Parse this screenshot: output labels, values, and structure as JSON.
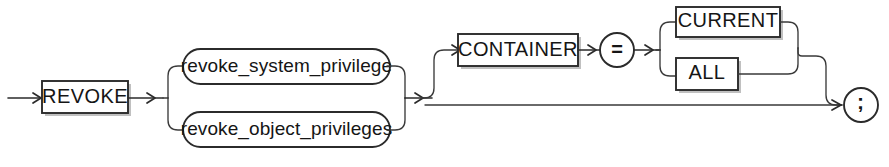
{
  "diagram": {
    "title": "REVOKE",
    "type": "railroad-syntax-diagram",
    "stroke_color": "#2b2b2b",
    "background_color": "#ffffff",
    "entry_arrow": "→",
    "nodes": {
      "revoke": {
        "label": "REVOKE",
        "shape": "rectangle",
        "kind": "keyword"
      },
      "revoke_system_privilege": {
        "label": "revoke_system_privilege",
        "shape": "stadium",
        "kind": "nonterminal"
      },
      "revoke_object_privileges": {
        "label": "revoke_object_privileges",
        "shape": "stadium",
        "kind": "nonterminal"
      },
      "container": {
        "label": "CONTAINER",
        "shape": "rectangle",
        "kind": "keyword"
      },
      "equals": {
        "label": "=",
        "shape": "circle",
        "kind": "operator"
      },
      "current": {
        "label": "CURRENT",
        "shape": "rectangle",
        "kind": "keyword"
      },
      "all": {
        "label": "ALL",
        "shape": "rectangle",
        "kind": "keyword"
      },
      "semicolon": {
        "label": ";",
        "shape": "circle",
        "kind": "terminator"
      }
    },
    "branch_groups": [
      {
        "name": "privilege-choice",
        "required": true,
        "options": [
          "revoke_system_privilege",
          "revoke_object_privileges"
        ]
      },
      {
        "name": "container-clause",
        "required": false,
        "options": [
          "CONTAINER = CURRENT",
          "CONTAINER = ALL",
          "(omitted)"
        ]
      },
      {
        "name": "container-value-choice",
        "required": true,
        "options": [
          "CURRENT",
          "ALL"
        ]
      }
    ],
    "watermarks": {
      "top": "",
      "right": "",
      "bottom": ""
    }
  }
}
